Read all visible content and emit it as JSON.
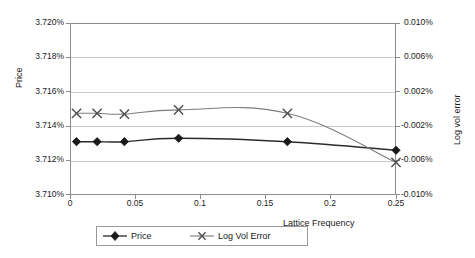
{
  "chart_data": {
    "type": "line",
    "title": "",
    "xlabel": "Lattice Frequency",
    "ylabel": "Price",
    "y2label": "Log vol error",
    "grid": true,
    "legend_position": "bottom",
    "xlim": [
      0,
      0.25
    ],
    "xticks": [
      "0",
      "0.05",
      "0.1",
      "0.15",
      "0.2",
      "0.25"
    ],
    "xtick_values": [
      0,
      0.05,
      0.1,
      0.15,
      0.2,
      0.25
    ],
    "ylim": [
      3.71,
      3.72
    ],
    "yticks": [
      "3.710%",
      "3.712%",
      "3.714%",
      "3.716%",
      "3.718%",
      "3.720%"
    ],
    "ytick_values": [
      3.71,
      3.712,
      3.714,
      3.716,
      3.718,
      3.72
    ],
    "y2lim": [
      -0.01,
      0.01
    ],
    "y2ticks": [
      "-0.010%",
      "-0.006%",
      "-0.002%",
      "0.002%",
      "0.006%",
      "0.010%"
    ],
    "y2tick_values": [
      -0.01,
      -0.006,
      -0.002,
      0.002,
      0.006,
      0.01
    ],
    "x": [
      0.005,
      0.0208,
      0.0417,
      0.0833,
      0.1667,
      0.25
    ],
    "series": [
      {
        "name": "Price",
        "axis": "left",
        "marker": "diamond",
        "color": "#2b2b2b",
        "values": [
          3.7131,
          3.7131,
          3.7131,
          3.7133,
          3.7131,
          3.7126
        ]
      },
      {
        "name": "Log Vol Error",
        "axis": "right",
        "marker": "x",
        "color": "#7d7d7d",
        "values": [
          -0.0005,
          -0.0005,
          -0.0006,
          -0.0001,
          -0.0005,
          -0.0062
        ]
      }
    ]
  },
  "axes": {
    "left_title": "Price",
    "right_title": "Log vol error",
    "x_title": "Lattice Frequency"
  },
  "legend": {
    "items": [
      {
        "label": "Price",
        "marker": "diamond-marker"
      },
      {
        "label": "Log Vol Error",
        "marker": "x-marker"
      }
    ]
  }
}
